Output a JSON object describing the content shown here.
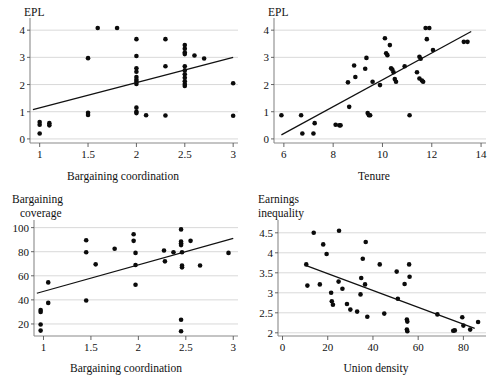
{
  "figure": {
    "title": "",
    "panel_count": 4
  },
  "chart_data": [
    {
      "id": "epl-vs-bargaining-coordination",
      "type": "scatter",
      "title": "",
      "ylabel": "EPL",
      "xlabel": "Bargaining coordination",
      "xlim": [
        0.9,
        3.05
      ],
      "ylim": [
        -0.15,
        4.3
      ],
      "xticks": [
        1,
        1.5,
        2,
        2.5,
        3
      ],
      "xticklabels": [
        "1",
        "1.5",
        "2",
        "2.5",
        "3"
      ],
      "yticks": [
        0,
        1,
        2,
        3,
        4
      ],
      "yticklabels": [
        "0",
        "1",
        "2",
        "3",
        "4"
      ],
      "grid": "horizontal",
      "legend": "none",
      "fit_line": {
        "x": [
          0.93,
          3.0
        ],
        "y": [
          1.08,
          3.0
        ]
      },
      "points": [
        [
          1.0,
          0.62
        ],
        [
          1.0,
          0.52
        ],
        [
          1.0,
          0.2
        ],
        [
          1.1,
          0.58
        ],
        [
          1.1,
          0.5
        ],
        [
          1.5,
          2.97
        ],
        [
          1.5,
          0.96
        ],
        [
          1.5,
          0.88
        ],
        [
          1.6,
          4.08
        ],
        [
          1.8,
          4.08
        ],
        [
          2.0,
          3.67
        ],
        [
          2.0,
          3.05
        ],
        [
          2.0,
          2.6
        ],
        [
          2.0,
          2.47
        ],
        [
          2.0,
          2.28
        ],
        [
          2.0,
          2.18
        ],
        [
          2.0,
          2.1
        ],
        [
          2.0,
          2.02
        ],
        [
          2.0,
          1.15
        ],
        [
          2.0,
          1.0
        ],
        [
          2.0,
          0.95
        ],
        [
          2.1,
          0.87
        ],
        [
          2.3,
          3.67
        ],
        [
          2.3,
          2.67
        ],
        [
          2.3,
          0.86
        ],
        [
          2.5,
          3.45
        ],
        [
          2.5,
          3.32
        ],
        [
          2.5,
          3.18
        ],
        [
          2.5,
          3.12
        ],
        [
          2.5,
          2.67
        ],
        [
          2.5,
          2.52
        ],
        [
          2.5,
          2.38
        ],
        [
          2.5,
          2.25
        ],
        [
          2.5,
          2.12
        ],
        [
          2.5,
          2.02
        ],
        [
          2.5,
          1.95
        ],
        [
          2.6,
          3.07
        ],
        [
          2.7,
          2.96
        ],
        [
          3.0,
          2.05
        ],
        [
          3.0,
          0.85
        ]
      ]
    },
    {
      "id": "epl-vs-tenure",
      "type": "scatter",
      "title": "",
      "ylabel": "EPL",
      "xlabel": "Tenure",
      "xlim": [
        5.6,
        14.2
      ],
      "ylim": [
        -0.15,
        4.3
      ],
      "xticks": [
        6,
        8,
        10,
        12,
        14
      ],
      "xticklabels": [
        "6",
        "8",
        "10",
        "12",
        "14"
      ],
      "yticks": [
        0,
        1,
        2,
        3,
        4
      ],
      "yticklabels": [
        "0",
        "1",
        "2",
        "3",
        "4"
      ],
      "grid": "horizontal",
      "legend": "none",
      "fit_line": {
        "x": [
          5.9,
          13.6
        ],
        "y": [
          0.15,
          3.95
        ]
      },
      "points": [
        [
          5.9,
          0.87
        ],
        [
          6.7,
          0.87
        ],
        [
          6.75,
          0.2
        ],
        [
          7.2,
          0.2
        ],
        [
          7.25,
          0.58
        ],
        [
          8.1,
          0.52
        ],
        [
          8.25,
          0.5
        ],
        [
          8.3,
          0.5
        ],
        [
          8.6,
          2.08
        ],
        [
          8.65,
          1.18
        ],
        [
          8.85,
          2.7
        ],
        [
          8.9,
          2.28
        ],
        [
          9.35,
          2.98
        ],
        [
          9.4,
          0.95
        ],
        [
          9.45,
          0.87
        ],
        [
          9.5,
          0.87
        ],
        [
          9.3,
          2.58
        ],
        [
          9.6,
          2.1
        ],
        [
          9.9,
          1.98
        ],
        [
          10.1,
          3.7
        ],
        [
          10.15,
          3.15
        ],
        [
          10.2,
          3.08
        ],
        [
          10.3,
          3.45
        ],
        [
          10.35,
          2.6
        ],
        [
          10.4,
          2.55
        ],
        [
          10.45,
          2.45
        ],
        [
          10.5,
          2.2
        ],
        [
          10.55,
          2.1
        ],
        [
          10.9,
          2.67
        ],
        [
          11.1,
          0.87
        ],
        [
          11.4,
          2.45
        ],
        [
          11.5,
          3.02
        ],
        [
          11.55,
          2.95
        ],
        [
          11.5,
          2.22
        ],
        [
          11.6,
          2.15
        ],
        [
          11.65,
          2.1
        ],
        [
          11.75,
          4.08
        ],
        [
          11.9,
          4.08
        ],
        [
          11.8,
          3.67
        ],
        [
          12.05,
          3.27
        ],
        [
          13.3,
          3.57
        ],
        [
          13.45,
          3.57
        ]
      ]
    },
    {
      "id": "bargaining-coverage-vs-coordination",
      "type": "scatter",
      "title": "",
      "ylabel": "Bargaining coverage",
      "ylabel_lines": [
        "Bargaining",
        "coverage"
      ],
      "xlabel": "Bargaining coordination",
      "xlim": [
        0.9,
        3.05
      ],
      "ylim": [
        10,
        103
      ],
      "xticks": [
        1,
        1.5,
        2,
        2.5,
        3
      ],
      "xticklabels": [
        "1",
        "1.5",
        "2",
        "2.5",
        "3"
      ],
      "yticks": [
        20,
        40,
        60,
        80,
        100
      ],
      "yticklabels": [
        "20",
        "40",
        "60",
        "80",
        "100"
      ],
      "grid": "horizontal",
      "legend": "none",
      "fit_line": {
        "x": [
          0.93,
          3.0
        ],
        "y": [
          45.5,
          91.0
        ]
      },
      "points": [
        [
          0.97,
          31.5
        ],
        [
          0.97,
          30.0
        ],
        [
          0.97,
          19.5
        ],
        [
          0.97,
          14.5
        ],
        [
          1.05,
          54.5
        ],
        [
          1.05,
          37.5
        ],
        [
          1.45,
          89.5
        ],
        [
          1.45,
          79.5
        ],
        [
          1.45,
          39.5
        ],
        [
          1.55,
          69.5
        ],
        [
          1.75,
          82.5
        ],
        [
          1.95,
          94.5
        ],
        [
          1.95,
          89.0
        ],
        [
          1.97,
          79.0
        ],
        [
          1.97,
          69.0
        ],
        [
          1.97,
          52.5
        ],
        [
          2.27,
          81.0
        ],
        [
          2.28,
          72.0
        ],
        [
          2.37,
          79.5
        ],
        [
          2.45,
          98.5
        ],
        [
          2.45,
          88.5
        ],
        [
          2.45,
          87.0
        ],
        [
          2.45,
          85.5
        ],
        [
          2.46,
          79.5
        ],
        [
          2.46,
          68.5
        ],
        [
          2.46,
          67.0
        ],
        [
          2.45,
          23.5
        ],
        [
          2.45,
          14.0
        ],
        [
          2.55,
          89.0
        ],
        [
          2.65,
          68.5
        ],
        [
          2.95,
          79.0
        ]
      ]
    },
    {
      "id": "earnings-inequality-vs-union-density",
      "type": "scatter",
      "title": "",
      "ylabel": "Earnings inequality",
      "ylabel_lines": [
        "Earnings",
        "inequality"
      ],
      "xlabel": "Union density",
      "xlim": [
        -2,
        90
      ],
      "ylim": [
        1.92,
        4.72
      ],
      "xticks": [
        0,
        20,
        40,
        60,
        80
      ],
      "xticklabels": [
        "0",
        "20",
        "40",
        "60",
        "80"
      ],
      "yticks": [
        2,
        2.5,
        3,
        3.5,
        4,
        4.5
      ],
      "yticklabels": [
        "2",
        "2.5",
        "3",
        "3.5",
        "4",
        "4.5"
      ],
      "grid": "horizontal",
      "legend": "none",
      "fit_line": {
        "x": [
          10.5,
          85.0
        ],
        "y": [
          3.68,
          2.11
        ]
      },
      "points": [
        [
          10.5,
          3.71
        ],
        [
          11.0,
          3.18
        ],
        [
          13.8,
          4.5
        ],
        [
          16.5,
          3.21
        ],
        [
          18.0,
          4.21
        ],
        [
          19.5,
          3.97
        ],
        [
          21.5,
          3.0
        ],
        [
          21.8,
          2.79
        ],
        [
          22.3,
          2.7
        ],
        [
          24.8,
          3.28
        ],
        [
          25.0,
          4.55
        ],
        [
          26.5,
          3.1
        ],
        [
          28.5,
          2.72
        ],
        [
          30.0,
          2.58
        ],
        [
          33.0,
          2.53
        ],
        [
          34.5,
          2.96
        ],
        [
          34.8,
          3.37
        ],
        [
          35.5,
          3.85
        ],
        [
          36.5,
          3.21
        ],
        [
          36.8,
          4.27
        ],
        [
          37.5,
          2.4
        ],
        [
          43.0,
          3.71
        ],
        [
          45.0,
          2.48
        ],
        [
          50.5,
          3.53
        ],
        [
          51.0,
          2.85
        ],
        [
          54.0,
          3.22
        ],
        [
          55.0,
          2.33
        ],
        [
          55.2,
          2.28
        ],
        [
          55.0,
          2.08
        ],
        [
          55.2,
          2.04
        ],
        [
          56.0,
          3.71
        ],
        [
          56.2,
          3.4
        ],
        [
          68.5,
          2.46
        ],
        [
          75.5,
          2.05
        ],
        [
          76.2,
          2.06
        ],
        [
          79.5,
          2.39
        ],
        [
          80.0,
          2.18
        ],
        [
          83.0,
          2.08
        ],
        [
          86.5,
          2.27
        ]
      ]
    }
  ]
}
